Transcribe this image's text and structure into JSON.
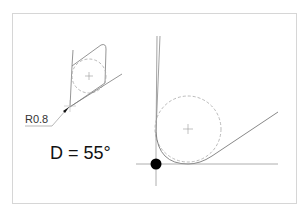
{
  "diagram": {
    "type": "tool-insert-nose-radius-detail",
    "insert_view": {
      "radius_label": "R0.8"
    },
    "angle_label": "D = 55°",
    "colors": {
      "line": "#7a7a7a",
      "dashed_circle": "#aaaaaa",
      "contact_point": "#000000",
      "frame": "#d6d6d6",
      "text": "#111111"
    }
  }
}
